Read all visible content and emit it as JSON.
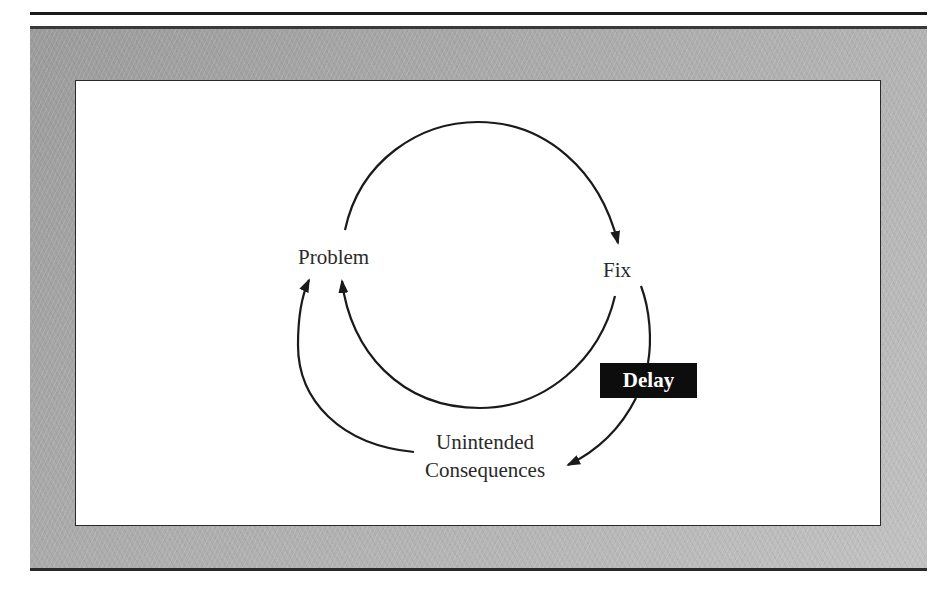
{
  "page": {
    "header_fragment": "...managing dynamic... typically..."
  },
  "diagram": {
    "type": "causal-loop",
    "nodes": {
      "problem": "Problem",
      "fix": "Fix",
      "unintended_line1": "Unintended",
      "unintended_line2": "Consequences",
      "delay": "Delay"
    },
    "edges": [
      {
        "from": "Problem",
        "to": "Fix"
      },
      {
        "from": "Fix",
        "to": "Problem"
      },
      {
        "from": "Fix",
        "to": "Unintended Consequences",
        "via": "Delay"
      },
      {
        "from": "Unintended Consequences",
        "to": "Problem"
      }
    ],
    "colors": {
      "frame": "#a7a7a7",
      "panel": "#ffffff",
      "stroke": "#1a1a1a",
      "delay_bg": "#0d0d0d",
      "delay_text": "#ffffff"
    }
  }
}
